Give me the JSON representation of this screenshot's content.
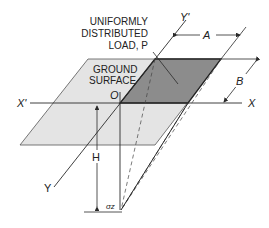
{
  "diagram": {
    "load_label": [
      "UNIFORMLY",
      "DISTRIBUTED",
      "LOAD, P"
    ],
    "surface_label": [
      "GROUND",
      "SURFACE"
    ],
    "origin_label": "O",
    "x_axis_label": "X",
    "x_prime_label": "X'",
    "y_axis_label": "Y",
    "y_prime_label": "Y'",
    "dim_a_label": "A",
    "dim_b_label": "B",
    "depth_label": "H",
    "stress_label": "σz",
    "colors": {
      "ground": "#e4e4e4",
      "load_area": "#8c8c8c",
      "line": "#2a2a2a"
    }
  }
}
